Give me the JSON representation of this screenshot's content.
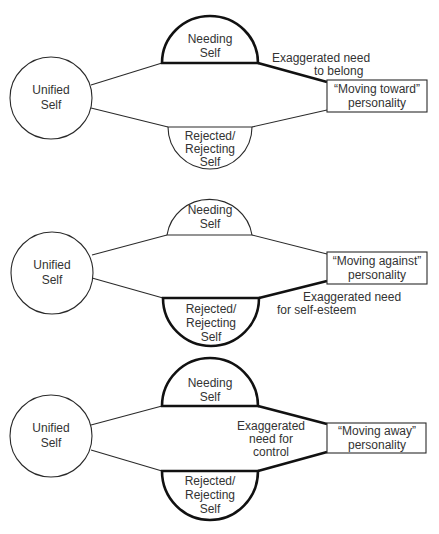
{
  "panels": [
    {
      "id": "moving-toward",
      "unified_self": {
        "line1": "Unified",
        "line2": "Self"
      },
      "needing_self": {
        "line1": "Needing",
        "line2": "Self",
        "emphasized": true
      },
      "rejected_self": {
        "line1": "Rejected/",
        "line2": "Rejecting",
        "line3": "Self",
        "emphasized": false
      },
      "personality_box": {
        "line1": "“Moving toward”",
        "line2": "personality"
      },
      "annotation": {
        "line1": "Exaggerated need",
        "line2": "to belong"
      }
    },
    {
      "id": "moving-against",
      "unified_self": {
        "line1": "Unified",
        "line2": "Self"
      },
      "needing_self": {
        "line1": "Needing",
        "line2": "Self",
        "emphasized": false
      },
      "rejected_self": {
        "line1": "Rejected/",
        "line2": "Rejecting",
        "line3": "Self",
        "emphasized": true
      },
      "personality_box": {
        "line1": "“Moving against”",
        "line2": "personality"
      },
      "annotation": {
        "line1": "Exaggerated need",
        "line2": "for self-esteem"
      }
    },
    {
      "id": "moving-away",
      "unified_self": {
        "line1": "Unified",
        "line2": "Self"
      },
      "needing_self": {
        "line1": "Needing",
        "line2": "Self",
        "emphasized": true
      },
      "rejected_self": {
        "line1": "Rejected/",
        "line2": "Rejecting",
        "line3": "Self",
        "emphasized": true
      },
      "personality_box": {
        "line1": "“Moving away”",
        "line2": "personality"
      },
      "annotation": {
        "line1": "Exaggerated",
        "line2": "need for",
        "line3": "control"
      }
    }
  ],
  "colors": {
    "line": "#2a2a2a",
    "emphasis_line": "#111111",
    "text": "#333333",
    "background": "#ffffff"
  }
}
